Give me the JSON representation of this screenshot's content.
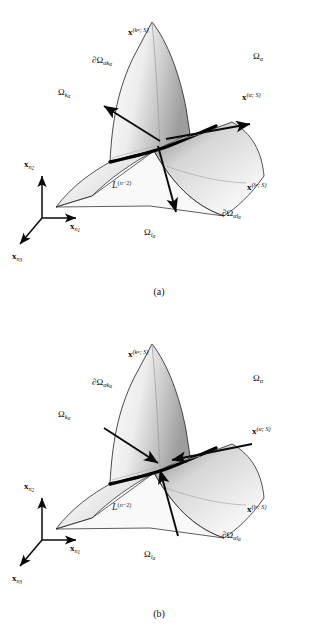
{
  "figure": {
    "domain_type": "diagram",
    "background_color": "#ffffff",
    "ink_color": "#0a0a0a",
    "surface_light": "#f2f2f2",
    "surface_mid": "#b8b8b8",
    "surface_dark": "#8a8a8a"
  },
  "panels": [
    {
      "id": "a",
      "caption": "(a)",
      "arrow_direction": "outward",
      "labels": {
        "x_k_alpha": {
          "base": "x",
          "sup_index": "k",
          "sup_index_sub": "α",
          "sup_tail": "; ",
          "sup_script": "S"
        },
        "x_alpha": {
          "base": "x",
          "sup_index": "α",
          "sup_tail": "; ",
          "sup_script": "S"
        },
        "x_l_alpha": {
          "base": "x",
          "sup_index": "l",
          "sup_index_sub": "α",
          "sup_tail": "; ",
          "sup_script": "S"
        },
        "d_omega_alpha_k": {
          "prefix": "∂Ω",
          "sub_main": "αk",
          "sub_sub": "α"
        },
        "d_omega_alpha_l": {
          "prefix": "∂Ω",
          "sub_main": "αl",
          "sub_sub": "α"
        },
        "omega_alpha": {
          "prefix": "Ω",
          "sub_main": "α"
        },
        "omega_k_alpha": {
          "prefix": "Ω",
          "sub_main": "k",
          "sub_sub": "α"
        },
        "omega_l_alpha": {
          "prefix": "Ω",
          "sub_main": "l",
          "sub_sub": "α"
        },
        "curve": {
          "script": "L",
          "sup": "(n−2)"
        }
      },
      "axes": {
        "x_n1": {
          "base": "x",
          "sub": "n",
          "subsub": "1"
        },
        "x_n2": {
          "base": "x",
          "sub": "n",
          "subsub": "2"
        },
        "x_n3": {
          "base": "x",
          "sub": "n",
          "subsub": "3"
        }
      }
    },
    {
      "id": "b",
      "caption": "(b)",
      "arrow_direction": "inward",
      "labels": {
        "x_k_alpha": {
          "base": "x",
          "sup_index": "k",
          "sup_index_sub": "α",
          "sup_tail": "; ",
          "sup_script": "S"
        },
        "x_alpha": {
          "base": "x",
          "sup_index": "α",
          "sup_tail": "; ",
          "sup_script": "S"
        },
        "x_l_alpha": {
          "base": "x",
          "sup_index": "l",
          "sup_index_sub": "α",
          "sup_tail": "; ",
          "sup_script": "S"
        },
        "d_omega_alpha_k": {
          "prefix": "∂Ω",
          "sub_main": "αk",
          "sub_sub": "α"
        },
        "d_omega_alpha_l": {
          "prefix": "∂Ω",
          "sub_main": "αl",
          "sub_sub": "α"
        },
        "omega_alpha": {
          "prefix": "Ω",
          "sub_main": "α"
        },
        "omega_k_alpha": {
          "prefix": "Ω",
          "sub_main": "k",
          "sub_sub": "α"
        },
        "omega_l_alpha": {
          "prefix": "Ω",
          "sub_main": "l",
          "sub_sub": "α"
        },
        "curve": {
          "script": "L",
          "sup": "(n−2)"
        }
      },
      "axes": {
        "x_n1": {
          "base": "x",
          "sub": "n",
          "subsub": "1"
        },
        "x_n2": {
          "base": "x",
          "sub": "n",
          "subsub": "2"
        },
        "x_n3": {
          "base": "x",
          "sub": "n",
          "subsub": "3"
        }
      }
    }
  ]
}
